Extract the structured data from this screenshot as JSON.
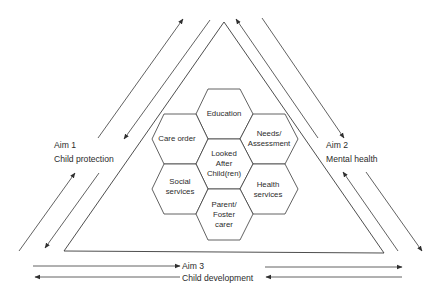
{
  "diagram": {
    "type": "triangle-with-hexagon-cluster",
    "center": {
      "label_lines": [
        "Looked",
        "After",
        "Child(ren)"
      ]
    },
    "hexagons": [
      {
        "id": "education",
        "label_lines": [
          "Education"
        ]
      },
      {
        "id": "care-order",
        "label_lines": [
          "Care order"
        ]
      },
      {
        "id": "needs-assessment",
        "label_lines": [
          "Needs/",
          "Assessment"
        ]
      },
      {
        "id": "social-services",
        "label_lines": [
          "Social",
          "services"
        ]
      },
      {
        "id": "health-services",
        "label_lines": [
          "Health",
          "services"
        ]
      },
      {
        "id": "parent-foster-carer",
        "label_lines": [
          "Parent/",
          "Foster",
          "carer"
        ]
      }
    ],
    "aims": [
      {
        "id": "aim-1",
        "title": "Aim 1",
        "subtitle": "Child protection",
        "side": "left"
      },
      {
        "id": "aim-2",
        "title": "Aim 2",
        "subtitle": "Mental health",
        "side": "right"
      },
      {
        "id": "aim-3",
        "title": "Aim 3",
        "subtitle": "Child development",
        "side": "bottom"
      }
    ],
    "colors": {
      "line": "#3a3a3a",
      "text": "#2b2b2b",
      "background": "#ffffff"
    }
  }
}
